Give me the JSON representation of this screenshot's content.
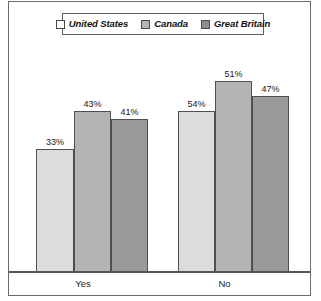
{
  "chart_data": {
    "type": "bar",
    "title": "",
    "subtitle": "",
    "xlabel": "",
    "ylabel": "",
    "categories": [
      "Yes",
      "No"
    ],
    "series": [
      {
        "name": "United States",
        "values": [
          33,
          43
        ],
        "color": "#dcdcdc",
        "swatch_color": "#fdfdfd"
      },
      {
        "name": "Canada",
        "values": [
          43,
          51
        ],
        "color": "#b4b4b4",
        "swatch_color": "#b4b4b4"
      },
      {
        "name": "Great Britain",
        "values": [
          41,
          47
        ],
        "color": "#9a9a9a",
        "swatch_color": "#8f8f8f"
      }
    ],
    "grid": false,
    "legend_position": "top",
    "ylim": [
      0,
      62
    ],
    "value_suffix": "%",
    "data_labels": {
      "yes": [
        "33%",
        "43%",
        "41%"
      ],
      "no": [
        "54%",
        "51%",
        "47%"
      ]
    }
  },
  "legend": {
    "entries": [
      {
        "label": "United States",
        "swatch": "legend-swatch-united-states"
      },
      {
        "label": "Canada",
        "swatch": "legend-swatch-canada"
      },
      {
        "label": "Great Britain",
        "swatch": "legend-swatch-great-britain"
      }
    ]
  },
  "axis": {
    "categories": [
      {
        "label": "Yes"
      },
      {
        "label": "No"
      }
    ]
  },
  "bars": {
    "yes": [
      {
        "label": "33%",
        "series": "United States",
        "value": 33
      },
      {
        "label": "43%",
        "series": "Canada",
        "value": 43
      },
      {
        "label": "41%",
        "series": "Great Britain",
        "value": 41
      }
    ],
    "no": [
      {
        "label": "54%",
        "series": "United States",
        "value": 54
      },
      {
        "label": "51%",
        "series": "Canada",
        "value": 51
      },
      {
        "label": "47%",
        "series": "Great Britain",
        "value": 47
      }
    ]
  },
  "colors": {
    "united_states": "#dcdcdc",
    "canada": "#b4b4b4",
    "great_britain": "#9a9a9a",
    "bar_outline": "#4f4f4f",
    "frame": "#6b6b6b",
    "baseline": "#555555"
  }
}
